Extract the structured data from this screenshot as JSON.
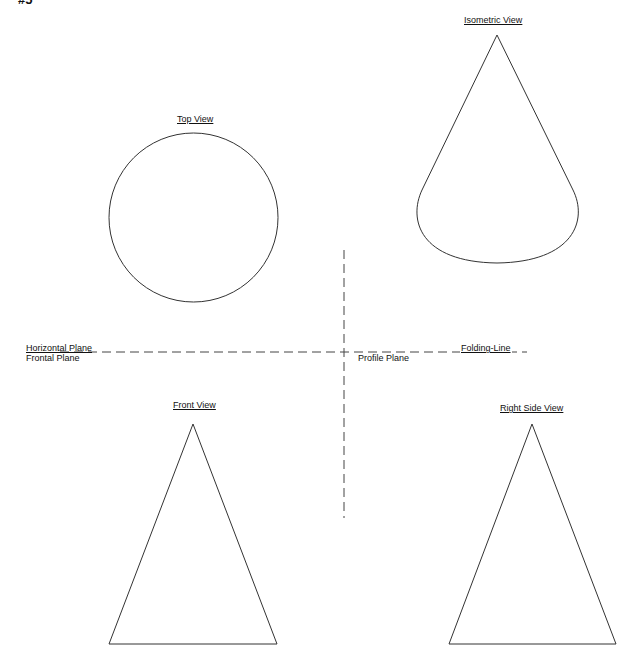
{
  "figure": {
    "number_label": "#5",
    "stroke_color": "#333333",
    "background": "#ffffff"
  },
  "views": {
    "top": {
      "title": "Top View",
      "shape": "circle"
    },
    "isometric": {
      "title": "Isometric View",
      "shape": "cone"
    },
    "front": {
      "title": "Front View",
      "shape": "triangle"
    },
    "right_side": {
      "title": "Right Side View",
      "shape": "triangle"
    }
  },
  "planes": {
    "horizontal": "Horizontal Plane",
    "frontal": "Frontal Plane",
    "profile": "Profile Plane",
    "folding_line": "Folding-Line"
  }
}
